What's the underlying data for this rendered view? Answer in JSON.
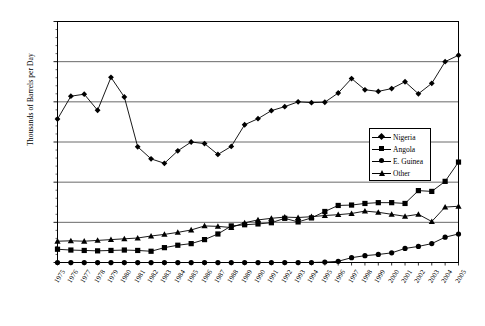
{
  "chart_data": {
    "type": "line",
    "title": "",
    "xlabel": "",
    "ylabel": "Thousands of Barrels per Day",
    "ylim": [
      0,
      3000
    ],
    "ytick_labels": [
      "0",
      "500",
      "1,000",
      "1,500",
      "2,000",
      "2,500",
      "3,000"
    ],
    "ytick_values": [
      0,
      500,
      1000,
      1500,
      2000,
      2500,
      3000
    ],
    "grid": "horizontal",
    "legend_position": "center-right",
    "categories": [
      "1975",
      "1976",
      "1977",
      "1978",
      "1979",
      "1980",
      "1981",
      "1982",
      "1983",
      "1984",
      "1985",
      "1986",
      "1987",
      "1988",
      "1989",
      "1990",
      "1991",
      "1992",
      "1993",
      "1994",
      "1995",
      "1996",
      "1997",
      "1998",
      "1999",
      "2000",
      "2001",
      "2002",
      "2003",
      "2004",
      "2005"
    ],
    "series": [
      {
        "name": "Nigeria",
        "marker": "diamond",
        "color": "#000000",
        "values": [
          1785,
          2070,
          2095,
          1895,
          2305,
          2060,
          1440,
          1290,
          1235,
          1390,
          1500,
          1480,
          1345,
          1445,
          1715,
          1790,
          1890,
          1940,
          2000,
          1990,
          1995,
          2110,
          2290,
          2150,
          2130,
          2165,
          2250,
          2100,
          2230,
          2500,
          2580
        ]
      },
      {
        "name": "Angola",
        "marker": "square",
        "color": "#000000",
        "values": [
          165,
          155,
          150,
          145,
          150,
          155,
          150,
          140,
          185,
          215,
          235,
          285,
          355,
          455,
          470,
          480,
          495,
          550,
          505,
          555,
          635,
          710,
          715,
          735,
          745,
          745,
          735,
          895,
          885,
          1010,
          1250
        ]
      },
      {
        "name": "E. Guinea",
        "marker": "circle",
        "color": "#000000",
        "values": [
          0,
          0,
          0,
          0,
          0,
          0,
          0,
          0,
          0,
          0,
          0,
          0,
          0,
          0,
          0,
          0,
          0,
          0,
          0,
          0,
          5,
          15,
          60,
          85,
          100,
          120,
          175,
          200,
          235,
          315,
          355
        ]
      },
      {
        "name": "Other",
        "marker": "triangle",
        "color": "#000000",
        "values": [
          265,
          270,
          265,
          275,
          285,
          295,
          305,
          330,
          350,
          375,
          405,
          455,
          450,
          435,
          495,
          530,
          550,
          565,
          560,
          570,
          585,
          595,
          610,
          640,
          625,
          600,
          575,
          600,
          510,
          690,
          700
        ]
      }
    ]
  },
  "legend": {
    "items": [
      {
        "label": "Nigeria",
        "marker": "diamond"
      },
      {
        "label": "Angola",
        "marker": "square"
      },
      {
        "label": "E. Guinea",
        "marker": "circle"
      },
      {
        "label": "Other",
        "marker": "triangle"
      }
    ]
  },
  "axis": {
    "y_title": "Thousands of Barrels per Day"
  }
}
